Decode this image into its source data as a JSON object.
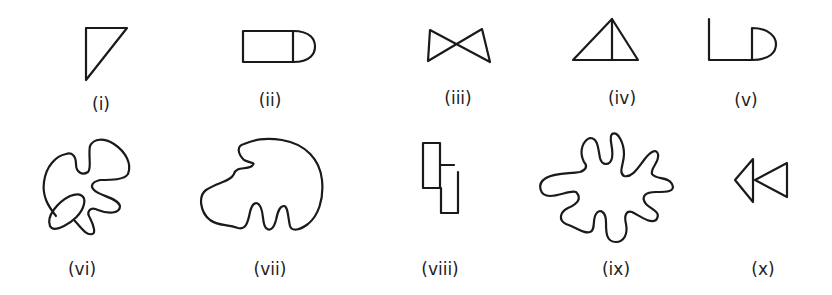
{
  "figure": {
    "stroke_color": "#1a1a1a",
    "background_color": "#ffffff",
    "shapes": [
      {
        "id": "i",
        "label": "(i)",
        "kind": "right triangle"
      },
      {
        "id": "ii",
        "label": "(ii)",
        "kind": "rectangle with semicircle cap"
      },
      {
        "id": "iii",
        "label": "(iii)",
        "kind": "bowtie of two triangles"
      },
      {
        "id": "iv",
        "label": "(iv)",
        "kind": "triangle with vertical median line"
      },
      {
        "id": "v",
        "label": "(v)",
        "kind": "L shape joined to D shape"
      },
      {
        "id": "vi",
        "label": "(vi)",
        "kind": "irregular blob with overlapping oval"
      },
      {
        "id": "vii",
        "label": "(vii)",
        "kind": "irregular closed curve with two fingers"
      },
      {
        "id": "viii",
        "label": "(viii)",
        "kind": "two offset rectangles"
      },
      {
        "id": "ix",
        "label": "(ix)",
        "kind": "many-lobed closed curve"
      },
      {
        "id": "x",
        "label": "(x)",
        "kind": "two triangles pointing left"
      }
    ]
  }
}
